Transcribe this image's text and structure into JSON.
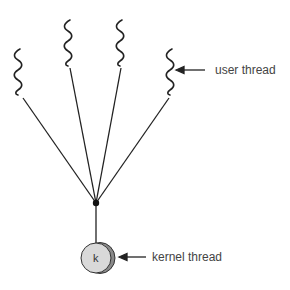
{
  "diagram": {
    "type": "many-to-one thread model",
    "user_thread_count": 4,
    "labels": {
      "user_thread": "user thread",
      "kernel_thread": "kernel thread",
      "kernel_symbol": "k"
    },
    "colors": {
      "line": "#222222",
      "kernel_fill": "#d9d9d9",
      "kernel_shadow": "#8a8a8a",
      "text": "#444444"
    }
  }
}
